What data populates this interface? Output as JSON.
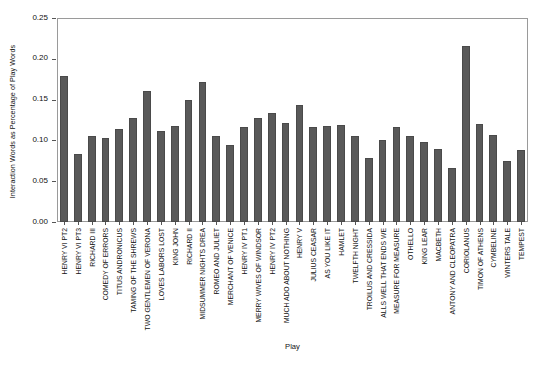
{
  "chart_data": {
    "type": "bar",
    "title": "",
    "xlabel": "Play",
    "ylabel": "Interaction Words as Percentage of Play Words",
    "ylim": [
      0.0,
      0.25
    ],
    "yticks": [
      "0.00",
      "0.05",
      "0.10",
      "0.15",
      "0.20",
      "0.25"
    ],
    "ytick_values": [
      0.0,
      0.05,
      0.1,
      0.15,
      0.2,
      0.25
    ],
    "grid": false,
    "legend": null,
    "bar_color": "#595959",
    "categories": [
      "HENRY VI PT2",
      "HENRY VI PT3",
      "RICHARD III",
      "COMEDY OF ERRORS",
      "TITUS ANDRONICUS",
      "TAMING OF THE SHREWS",
      "TWO GENTLEMEN OF VERONA",
      "LOVES LABORS LOST",
      "KING JOHN",
      "RICHARD II",
      "MIDSUMMER NIGHTS DREA",
      "ROMEO AND JULIET",
      "MERCHANT OF VENICE",
      "HENRY IV PT1",
      "MERRY WIVES OF WINDSOR",
      "HENRY IV PT2",
      "MUCH ADO ABOUT NOTHING",
      "HENRY V",
      "JULIUS CEASAR",
      "AS YOU LIKE IT",
      "HAMLET",
      "TWELFTH NIGHT",
      "TROILUS AND CRESSIDA",
      "ALLS WELL THAT ENDS WE",
      "MEASURE FOR MEASURE",
      "OTHELLO",
      "KING LEAR",
      "MACBETH",
      "ANTONY AND CLEOPATRA",
      "CORIOLANUS",
      "TIMON OF ATHENS",
      "CYMBELINE",
      "WINTERS TALE",
      "TEMPEST"
    ],
    "values": [
      0.179,
      0.083,
      0.105,
      0.103,
      0.114,
      0.127,
      0.16,
      0.112,
      0.118,
      0.15,
      0.171,
      0.106,
      0.094,
      0.117,
      0.128,
      0.133,
      0.121,
      0.143,
      0.116,
      0.118,
      0.119,
      0.105,
      0.078,
      0.1,
      0.116,
      0.106,
      0.098,
      0.089,
      0.066,
      0.216,
      0.12,
      0.107,
      0.075,
      0.088
    ]
  }
}
